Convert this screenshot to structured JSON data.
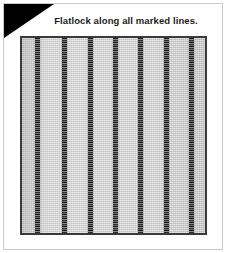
{
  "card": {
    "step_badge": {
      "number": "5",
      "badge_color": "#000000",
      "number_color": "#ffffff"
    },
    "title": "Flatlock along all marked lines.",
    "border_color": "#c9c9c9",
    "background_color": "#ffffff"
  },
  "illustration": {
    "name": "fabric-swatch-with-flatlock-seams",
    "fabric_color": "#d2d2d2",
    "panel_border_color": "#3a3a3a",
    "seam_color": "#3c3c3c",
    "seam_count": 7,
    "seam_positions_percent": [
      8.5,
      23.0,
      37.5,
      51.0,
      65.0,
      79.0,
      92.5
    ],
    "seam_orientation": "vertical"
  }
}
